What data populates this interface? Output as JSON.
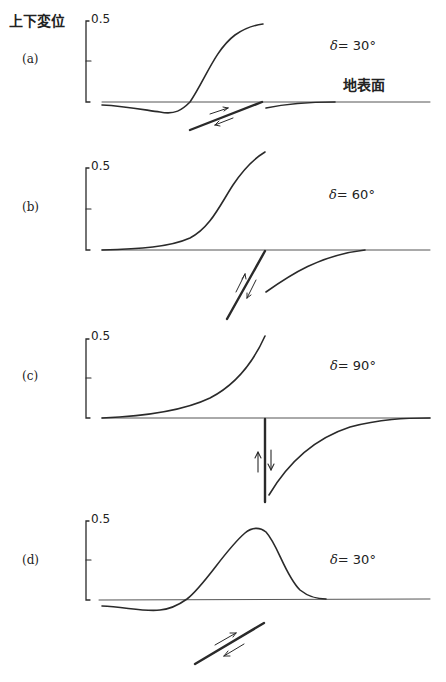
{
  "figure": {
    "y_axis_label": "上下変位",
    "surface_label": "地表面",
    "panels": [
      {
        "id": "a",
        "label": "(a)",
        "tick_top": "0.5",
        "delta_symbol": "δ",
        "delta_text": "= 30°",
        "dip_deg": 30,
        "variant": "buried fault"
      },
      {
        "id": "b",
        "label": "(b)",
        "tick_top": "0.5",
        "delta_symbol": "δ",
        "delta_text": "= 60°",
        "dip_deg": 60,
        "variant": "fault reaching surface"
      },
      {
        "id": "c",
        "label": "(c)",
        "tick_top": "0.5",
        "delta_symbol": "δ",
        "delta_text": "= 90°",
        "dip_deg": 90,
        "variant": "vertical fault reaching surface"
      },
      {
        "id": "d",
        "label": "(d)",
        "tick_top": "0.5",
        "delta_symbol": "δ",
        "delta_text": "= 30°",
        "dip_deg": 30,
        "variant": "deeply buried fault"
      }
    ]
  },
  "colors": {
    "line": "#2a2a2a",
    "baseline": "#555555",
    "background": "#ffffff"
  }
}
